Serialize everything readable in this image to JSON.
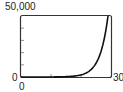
{
  "chart_data": {
    "type": "line",
    "title": "",
    "xlabel": "",
    "ylabel": "",
    "xlim": [
      0,
      30
    ],
    "ylim": [
      0,
      50000
    ],
    "x_ticks": [
      0,
      10,
      20,
      30
    ],
    "y_ticks": [
      0,
      10000,
      20000,
      30000,
      40000,
      50000
    ],
    "grid": false,
    "series": [
      {
        "name": "exponential curve",
        "x": [
          0,
          5,
          10,
          15,
          18,
          20,
          22,
          24,
          26,
          27,
          28,
          29
        ],
        "y": [
          1,
          6,
          40,
          300,
          900,
          2000,
          4500,
          9500,
          20000,
          29000,
          41000,
          50000
        ]
      }
    ]
  },
  "labels": {
    "y_max": "50,000",
    "y_min": "0",
    "x_min": "0",
    "x_max": "30"
  }
}
